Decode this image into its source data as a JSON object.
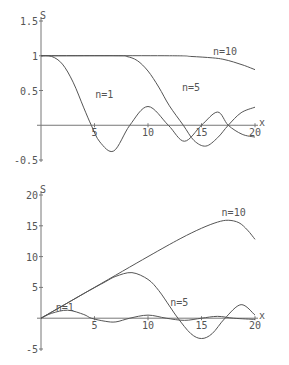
{
  "chart_data": [
    {
      "type": "line",
      "title": "",
      "xlabel": "x",
      "ylabel": "S",
      "xlim": [
        0,
        20
      ],
      "ylim": [
        -0.5,
        1.5
      ],
      "xticks": [
        "5",
        "10",
        "15",
        "20"
      ],
      "yticks": [
        "1.5",
        "1",
        "0.5",
        "-0.5"
      ],
      "grid": false,
      "series": [
        {
          "name": "n=1",
          "x": [
            0,
            1,
            2,
            3,
            4,
            4.7,
            5.5,
            6.8,
            8.3,
            10,
            11.9,
            13.4,
            15,
            16.5,
            17.5,
            18.8,
            20
          ],
          "values": [
            1,
            0.99,
            0.88,
            0.62,
            0.25,
            0,
            -0.24,
            -0.37,
            0,
            0.27,
            0,
            -0.23,
            0,
            0.19,
            0,
            -0.13,
            -0.17
          ]
        },
        {
          "name": "n=5",
          "x": [
            0,
            7,
            8,
            9,
            10,
            11,
            12,
            13.3,
            14.3,
            15.4,
            16.5,
            17.5,
            18.7,
            20
          ],
          "values": [
            1,
            1,
            0.99,
            0.93,
            0.78,
            0.55,
            0.28,
            0,
            -0.22,
            -0.3,
            -0.18,
            0,
            0.18,
            0.26
          ]
        },
        {
          "name": "n=10",
          "x": [
            0,
            12,
            14,
            16,
            17,
            18,
            19,
            20
          ],
          "values": [
            1,
            1,
            0.99,
            0.97,
            0.95,
            0.91,
            0.86,
            0.8
          ]
        }
      ],
      "annotations": [
        {
          "text": "n=1",
          "x": 6.2,
          "y": 0.45
        },
        {
          "text": "n=5",
          "x": 14.3,
          "y": 0.55
        },
        {
          "text": "n=10",
          "x": 17.2,
          "y": 1.07
        }
      ]
    },
    {
      "type": "line",
      "title": "",
      "xlabel": "x",
      "ylabel": "S",
      "xlim": [
        0,
        20
      ],
      "ylim": [
        -5,
        20
      ],
      "xticks": [
        "5",
        "10",
        "15",
        "20"
      ],
      "yticks": [
        "20",
        "15",
        "10",
        "5",
        "-5"
      ],
      "grid": false,
      "series": [
        {
          "name": "n=1",
          "x": [
            0,
            1,
            2.5,
            4,
            4.7,
            6,
            7,
            8.3,
            10,
            11.7,
            13.4,
            15,
            16.5,
            18,
            20
          ],
          "values": [
            0,
            0.8,
            1.3,
            0.6,
            0,
            -0.5,
            -0.6,
            0,
            0.5,
            0,
            -0.35,
            0,
            0.3,
            0,
            -0.2
          ]
        },
        {
          "name": "n=5",
          "x": [
            0,
            2,
            4,
            6,
            7,
            8.5,
            10,
            11,
            12,
            12.8,
            14,
            15,
            16,
            17.2,
            18.7,
            20
          ],
          "values": [
            0,
            2,
            4,
            5.9,
            6.8,
            7.4,
            6.3,
            4.5,
            2,
            0,
            -2.5,
            -3.3,
            -2.5,
            0,
            2.2,
            0.5
          ]
        },
        {
          "name": "n=10",
          "x": [
            0,
            5,
            10,
            13,
            15,
            16.5,
            17.5,
            18.5,
            19.3,
            20
          ],
          "values": [
            0,
            5,
            10,
            12.9,
            14.6,
            15.6,
            15.9,
            15.5,
            14.3,
            12.8
          ]
        }
      ],
      "annotations": [
        {
          "text": "n=1",
          "x": 2.5,
          "y": 1.8
        },
        {
          "text": "n=5",
          "x": 13.2,
          "y": 2.6
        },
        {
          "text": "n=10",
          "x": 18,
          "y": 17.3
        }
      ]
    }
  ],
  "axes_labels": {
    "x": "x",
    "y": "S"
  }
}
